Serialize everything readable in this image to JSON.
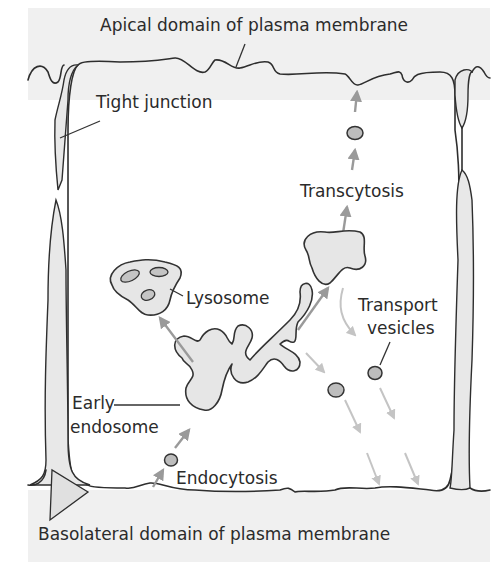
{
  "diagram": {
    "title_top": "Apical domain of plasma membrane",
    "title_bottom": "Basolateral domain of plasma membrane",
    "labels": {
      "tight_junction": "Tight junction",
      "transcytosis": "Transcytosis",
      "lysosome": "Lysosome",
      "transport_vesicles_line1": "Transport",
      "transport_vesicles_line2": "vesicles",
      "early_endosome_line1": "Early",
      "early_endosome_line2": "endosome",
      "endocytosis": "Endocytosis"
    },
    "colors": {
      "background_band": "#f0f0f0",
      "cell_interior": "#ffffff",
      "organelle_fill": "#e6e6e6",
      "vesicle_fill": "#bdbdbd",
      "outline": "#2e2e2e",
      "arrow_primary": "#9a9a9a",
      "arrow_secondary": "#c4c4c4"
    }
  }
}
